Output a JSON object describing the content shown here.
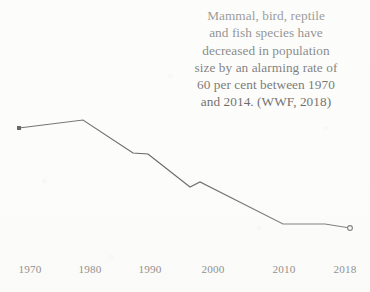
{
  "caption": {
    "lines": [
      "Mammal, bird, reptile",
      "and fish species have",
      "decreased in population",
      "size by an alarming rate of",
      "60 per cent between 1970",
      "and 2014. (WWF, 2018)"
    ],
    "full_text": "Mammal, bird, reptile and fish species have decreased in population size by an alarming rate of 60 per cent between 1970 and 2014. (WWF, 2018)"
  },
  "colors": {
    "background": "#fdfdfc",
    "line": "#333333",
    "text": "#1a1a1a",
    "marker": "#222222"
  },
  "chart_data": {
    "type": "line",
    "title": "",
    "xlabel": "",
    "ylabel": "",
    "grid": false,
    "legend": "none",
    "xlim": [
      1970,
      2018
    ],
    "ylim": [
      0,
      100
    ],
    "x_tick_labels": [
      "1970",
      "1980",
      "1990",
      "2000",
      "2010",
      "2018"
    ],
    "x_tick_values": [
      1970,
      1980,
      1990,
      2000,
      2010,
      2018
    ],
    "x_tick_px": [
      30,
      90,
      150,
      213,
      284,
      345
    ],
    "series": [
      {
        "name": "Living Planet Index",
        "x": [
          1970,
          1978,
          1987,
          1989,
          1996,
          1998,
          2010,
          2015,
          2018
        ],
        "values": [
          100,
          106,
          76,
          75,
          51,
          55,
          28,
          28,
          25
        ],
        "points_px": [
          [
            19,
            128
          ],
          [
            83,
            120
          ],
          [
            133,
            153
          ],
          [
            148,
            154
          ],
          [
            190,
            187
          ],
          [
            200,
            182
          ],
          [
            283,
            224
          ],
          [
            325,
            224
          ],
          [
            350,
            228
          ]
        ],
        "start_marker": "square",
        "end_marker": "open-circle"
      }
    ]
  }
}
